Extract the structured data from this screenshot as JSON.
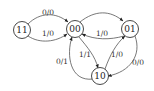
{
  "diagram": {
    "type": "state-machine",
    "nodes": [
      {
        "id": "n11",
        "label": "11",
        "x": 22,
        "y": 30
      },
      {
        "id": "n00",
        "label": "00",
        "x": 75,
        "y": 29
      },
      {
        "id": "n01",
        "label": "01",
        "x": 130,
        "y": 29
      },
      {
        "id": "n10",
        "label": "10",
        "x": 100,
        "y": 76
      }
    ],
    "edges": [
      {
        "from": "11",
        "to": "00",
        "label": "0/0"
      },
      {
        "from": "11",
        "to": "00",
        "label": "1/0"
      },
      {
        "from": "00",
        "to": "01",
        "label": ""
      },
      {
        "from": "01",
        "to": "00",
        "label": "1/0"
      },
      {
        "from": "00",
        "to": "10",
        "label": "1/1"
      },
      {
        "from": "10",
        "to": "00",
        "label": "0/1"
      },
      {
        "from": "10",
        "to": "01",
        "label": "1/0"
      },
      {
        "from": "01",
        "to": "10",
        "label": "0/0"
      }
    ],
    "colors": {
      "stroke": "#333333",
      "text": "#222222",
      "background": "#ffffff"
    }
  }
}
